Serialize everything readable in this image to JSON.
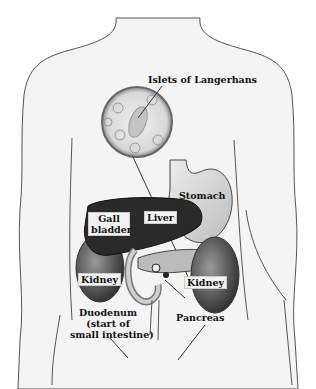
{
  "diagram": {
    "labels": {
      "islets": "Islets of Langerhans",
      "stomach": "Stomach",
      "liver": "Liver",
      "gall_bladder_1": "Gall",
      "gall_bladder_2": "bladder",
      "kidney_left": "Kidney",
      "kidney_right": "Kidney",
      "duodenum_1": "Duodenum",
      "duodenum_2": "(start of",
      "duodenum_3": "small intestine)",
      "pancreas": "Pancreas"
    },
    "colors": {
      "body_fill": "#f4f4f4",
      "outline": "#555555",
      "liver": "#2a2a2a",
      "kidney": "#4a4a4a",
      "stomach": "#dcdcdc",
      "label_box": "#f2f2f2"
    }
  }
}
